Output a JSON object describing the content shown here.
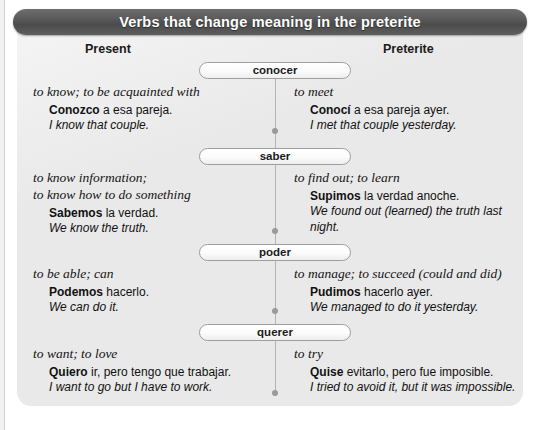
{
  "title": "Verbs that change meaning in the preterite",
  "columns": {
    "present": "Present",
    "preterite": "Preterite"
  },
  "rows": [
    {
      "verb": "conocer",
      "present": {
        "gloss": "to know; to be acquainted with",
        "example_bold": "Conozco",
        "example_rest": " a esa pareja.",
        "translation": "I know that couple."
      },
      "preterite": {
        "gloss": "to meet",
        "example_bold": "Conocí",
        "example_rest": " a esa pareja ayer.",
        "translation": "I met that couple yesterday."
      }
    },
    {
      "verb": "saber",
      "present": {
        "gloss": "to know information;\nto know how to do something",
        "example_bold": "Sabemos",
        "example_rest": " la verdad.",
        "translation": "We know the truth."
      },
      "preterite": {
        "gloss": "to find out; to learn",
        "example_bold": "Supimos",
        "example_rest": " la verdad anoche.",
        "translation": "We found out (learned) the truth last night."
      }
    },
    {
      "verb": "poder",
      "present": {
        "gloss": "to be able; can",
        "example_bold": "Podemos",
        "example_rest": " hacerlo.",
        "translation": "We can do it."
      },
      "preterite": {
        "gloss": "to manage; to succeed (could and did)",
        "example_bold": "Pudimos",
        "example_rest": " hacerlo ayer.",
        "translation": "We managed to do it yesterday."
      }
    },
    {
      "verb": "querer",
      "present": {
        "gloss": "to want; to love",
        "example_bold": "Quiero",
        "example_rest": " ir, pero tengo que trabajar.",
        "translation": "I want to go but I have to work."
      },
      "preterite": {
        "gloss": "to try",
        "example_bold": "Quise",
        "example_rest": " evitarlo, pero fue imposible.",
        "translation": "I tried to avoid it, but it was impossible."
      }
    }
  ],
  "colors": {
    "title_bar": "#5a5a5a",
    "panel": "#e9e9e9",
    "spine": "#b4b4b4",
    "pill_border": "#9e9e9e",
    "text": "#111111"
  }
}
